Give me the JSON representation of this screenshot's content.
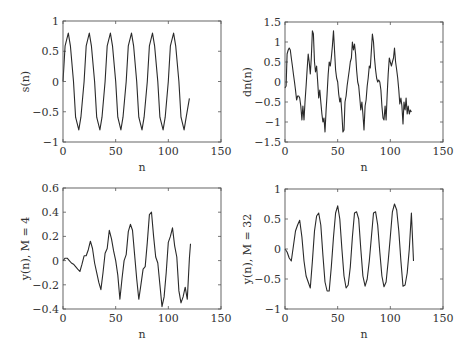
{
  "figure": {
    "background": "#ffffff",
    "axis_color": "#555555",
    "line_color": "#2a2a2a"
  },
  "chart_data": [
    {
      "id": "s",
      "type": "line",
      "title": "",
      "xlabel": "n",
      "ylabel": "s(n)",
      "xlim": [
        0,
        150
      ],
      "ylim": [
        -1,
        1
      ],
      "xticks": [
        0,
        50,
        100,
        150
      ],
      "yticks": [
        -1,
        -0.5,
        0,
        0.5,
        1
      ],
      "xtick_labels": [
        "0",
        "50",
        "100",
        "150"
      ],
      "ytick_labels": [
        "−1",
        "−0.5",
        "0",
        "0.5",
        "1"
      ],
      "grid": false,
      "box": {
        "left": 63,
        "top": 21,
        "right": 221,
        "bottom": 142
      },
      "description": "Sinusoid, amplitude ~0.8, period 20 samples, n = 0..120",
      "x": [
        0,
        2,
        5,
        7,
        10,
        12,
        15,
        17,
        20,
        22,
        25,
        27,
        30,
        32,
        35,
        37,
        40,
        42,
        45,
        47,
        50,
        52,
        55,
        57,
        60,
        62,
        65,
        67,
        70,
        72,
        75,
        77,
        80,
        82,
        85,
        87,
        90,
        92,
        95,
        97,
        100,
        102,
        105,
        107,
        110,
        112,
        115,
        117,
        120
      ],
      "y": [
        0,
        0.59,
        0.8,
        0.59,
        0,
        -0.59,
        -0.8,
        -0.59,
        0,
        0.59,
        0.8,
        0.59,
        0,
        -0.59,
        -0.8,
        -0.59,
        0,
        0.59,
        0.8,
        0.59,
        0,
        -0.59,
        -0.8,
        -0.59,
        0,
        0.59,
        0.8,
        0.59,
        0,
        -0.59,
        -0.8,
        -0.59,
        0,
        0.59,
        0.8,
        0.59,
        0,
        -0.59,
        -0.8,
        -0.59,
        0,
        0.59,
        0.8,
        0.59,
        0,
        -0.59,
        -0.8,
        -0.59,
        -0.28
      ]
    },
    {
      "id": "dn",
      "type": "line",
      "title": "",
      "xlabel": "n",
      "ylabel": "dn(n)",
      "xlim": [
        0,
        150
      ],
      "ylim": [
        -1.5,
        1.5
      ],
      "xticks": [
        0,
        50,
        100,
        150
      ],
      "yticks": [
        -1.5,
        -1,
        -0.5,
        0,
        0.5,
        1,
        1.5
      ],
      "xtick_labels": [
        "0",
        "50",
        "100",
        "150"
      ],
      "ytick_labels": [
        "−1.5",
        "−1",
        "−0.5",
        "0",
        "0.5",
        "1",
        "1.5"
      ],
      "grid": false,
      "box": {
        "left": 285,
        "top": 22,
        "right": 443,
        "bottom": 142
      },
      "description": "Noisy/interfered version of s(n), peaks up to ~1.3, troughs ~-1.3",
      "x": [
        0,
        1,
        2,
        3,
        4,
        5,
        6,
        7,
        8,
        9,
        10,
        11,
        12,
        13,
        14,
        15,
        16,
        17,
        18,
        19,
        20,
        21,
        22,
        23,
        24,
        25,
        26,
        27,
        28,
        29,
        30,
        31,
        32,
        33,
        34,
        35,
        36,
        37,
        38,
        39,
        40,
        41,
        42,
        43,
        44,
        45,
        46,
        47,
        48,
        49,
        50,
        51,
        52,
        53,
        54,
        55,
        56,
        57,
        58,
        59,
        60,
        61,
        62,
        63,
        64,
        65,
        66,
        67,
        68,
        69,
        70,
        71,
        72,
        73,
        74,
        75,
        76,
        77,
        78,
        79,
        80,
        81,
        82,
        83,
        84,
        85,
        86,
        87,
        88,
        89,
        90,
        91,
        92,
        93,
        94,
        95,
        96,
        97,
        98,
        99,
        100,
        101,
        102,
        103,
        104,
        105,
        106,
        107,
        108,
        109,
        110,
        111,
        112,
        113,
        114,
        115,
        116,
        117,
        118,
        119,
        120
      ],
      "y": [
        -0.15,
        -0.1,
        0.7,
        0.8,
        0.85,
        0.8,
        0.6,
        0.4,
        0.2,
        0.0,
        -0.2,
        -0.45,
        -0.35,
        -0.35,
        -0.4,
        -0.6,
        -0.95,
        -0.6,
        -0.95,
        -0.5,
        -0.1,
        0.3,
        0.7,
        0.5,
        0.2,
        0.6,
        1.28,
        1.2,
        0.5,
        0.25,
        0.4,
        0.0,
        -0.4,
        -0.2,
        -0.5,
        -0.8,
        -1.0,
        -0.9,
        -1.25,
        -0.7,
        -0.3,
        0.2,
        0.5,
        0.4,
        0.6,
        0.9,
        1.28,
        0.8,
        0.3,
        0.1,
        0.0,
        -0.3,
        -0.5,
        -0.4,
        -0.8,
        -1.25,
        -1.2,
        -0.5,
        -0.35,
        -0.1,
        0.1,
        0.3,
        0.5,
        0.6,
        1.0,
        0.8,
        0.95,
        0.7,
        0.3,
        0.0,
        -0.1,
        -0.4,
        -0.7,
        -0.5,
        -0.8,
        -1.2,
        -0.6,
        -0.45,
        -0.1,
        0.1,
        0.4,
        0.35,
        0.8,
        1.2,
        1.0,
        0.6,
        0.3,
        0.1,
        0.0,
        0.05,
        0.0,
        -0.2,
        -0.6,
        -0.9,
        -0.95,
        -0.6,
        -0.95,
        -0.3,
        0.2,
        0.6,
        0.5,
        0.4,
        0.5,
        0.6,
        0.85,
        0.5,
        0.3,
        0.1,
        -0.2,
        -0.55,
        -0.4,
        -0.6,
        -1.05,
        -0.5,
        -0.7,
        -0.4,
        -0.8,
        -0.6,
        -0.8,
        -0.7,
        -0.75,
        -0.8
      ]
    },
    {
      "id": "y4",
      "type": "line",
      "title": "",
      "xlabel": "n",
      "ylabel": "y(n), M = 4",
      "xlim": [
        0,
        150
      ],
      "ylim": [
        -0.4,
        0.6
      ],
      "xticks": [
        0,
        50,
        100,
        150
      ],
      "yticks": [
        -0.4,
        -0.2,
        0,
        0.2,
        0.4,
        0.6
      ],
      "xtick_labels": [
        "0",
        "50",
        "100",
        "150"
      ],
      "ytick_labels": [
        "−0.4",
        "−0.2",
        "0",
        "0.2",
        "0.4",
        "0.6"
      ],
      "grid": false,
      "box": {
        "left": 63,
        "top": 188,
        "right": 221,
        "bottom": 309
      },
      "description": "Adaptive filter output with M = 4, growing oscillation, max ~0.4",
      "x": [
        0,
        2,
        4,
        6,
        8,
        10,
        12,
        14,
        16,
        18,
        20,
        22,
        24,
        26,
        28,
        30,
        32,
        34,
        36,
        38,
        40,
        42,
        44,
        46,
        48,
        50,
        52,
        54,
        56,
        58,
        60,
        62,
        64,
        66,
        68,
        70,
        72,
        74,
        76,
        78,
        80,
        82,
        84,
        86,
        88,
        90,
        92,
        94,
        96,
        98,
        100,
        102,
        104,
        106,
        108,
        110,
        112,
        114,
        116,
        118,
        120,
        121
      ],
      "y": [
        0,
        0.02,
        0.02,
        0.0,
        -0.02,
        -0.03,
        -0.05,
        -0.07,
        -0.09,
        -0.03,
        0.04,
        0.04,
        0.09,
        0.16,
        0.1,
        -0.02,
        -0.1,
        -0.18,
        -0.24,
        -0.1,
        0.06,
        0.1,
        0.25,
        0.18,
        0.08,
        0.0,
        -0.12,
        -0.32,
        -0.15,
        0.0,
        0.05,
        0.24,
        0.3,
        0.25,
        0.05,
        -0.15,
        -0.32,
        -0.2,
        -0.07,
        -0.05,
        0.15,
        0.38,
        0.4,
        0.2,
        0.03,
        -0.02,
        -0.2,
        -0.38,
        -0.3,
        -0.1,
        0.15,
        0.2,
        0.27,
        0.12,
        0.03,
        -0.25,
        -0.35,
        -0.3,
        -0.22,
        -0.32,
        0.02,
        0.14
      ]
    },
    {
      "id": "y32",
      "type": "line",
      "title": "",
      "xlabel": "n",
      "ylabel": "y(n), M = 32",
      "xlim": [
        0,
        150
      ],
      "ylim": [
        -1,
        1
      ],
      "xticks": [
        0,
        50,
        100,
        150
      ],
      "yticks": [
        -1,
        -0.5,
        0,
        0.5,
        1
      ],
      "xtick_labels": [
        "0",
        "50",
        "100",
        "150"
      ],
      "ytick_labels": [
        "−1",
        "−0.5",
        "0",
        "0.5",
        "1"
      ],
      "grid": false,
      "box": {
        "left": 285,
        "top": 189,
        "right": 443,
        "bottom": 309
      },
      "description": "Adaptive filter output with M = 32, converges to sinusoid amplitude ~0.65-0.75",
      "x": [
        0,
        2,
        4,
        6,
        8,
        10,
        12,
        14,
        16,
        18,
        20,
        22,
        24,
        26,
        28,
        30,
        32,
        34,
        36,
        38,
        40,
        42,
        44,
        46,
        48,
        50,
        52,
        54,
        56,
        58,
        60,
        62,
        64,
        66,
        68,
        70,
        72,
        74,
        76,
        78,
        80,
        82,
        84,
        86,
        88,
        90,
        92,
        94,
        96,
        98,
        100,
        102,
        104,
        106,
        108,
        110,
        112,
        114,
        116,
        118,
        120,
        122
      ],
      "y": [
        0,
        -0.05,
        -0.15,
        -0.2,
        0.05,
        0.3,
        0.4,
        0.48,
        0.2,
        -0.2,
        -0.45,
        -0.55,
        -0.65,
        -0.2,
        0.3,
        0.55,
        0.6,
        0.4,
        -0.1,
        -0.55,
        -0.7,
        -0.7,
        -0.3,
        0.2,
        0.6,
        0.72,
        0.5,
        0.0,
        -0.45,
        -0.65,
        -0.6,
        -0.3,
        0.2,
        0.6,
        0.62,
        0.5,
        0.0,
        -0.45,
        -0.62,
        -0.5,
        -0.2,
        0.2,
        0.6,
        0.62,
        0.4,
        -0.05,
        -0.45,
        -0.63,
        -0.55,
        -0.2,
        0.2,
        0.62,
        0.75,
        0.65,
        0.3,
        -0.2,
        -0.62,
        -0.6,
        -0.4,
        0.0,
        0.6,
        -0.2
      ]
    }
  ]
}
